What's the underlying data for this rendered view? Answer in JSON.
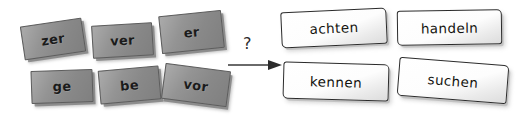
{
  "exercise": {
    "type": "word-formation-matching",
    "language": "German",
    "connector": {
      "question_mark": "?",
      "arrow_icon": "right-arrow-icon"
    },
    "prefixes": [
      {
        "label": "zer",
        "x": 22,
        "y": 22,
        "w": 62,
        "h": 34,
        "rotate": -8.5
      },
      {
        "label": "ver",
        "x": 92,
        "y": 24,
        "w": 61,
        "h": 33,
        "rotate": -3.5
      },
      {
        "label": "er",
        "x": 160,
        "y": 13,
        "w": 63,
        "h": 38,
        "rotate": -6.0
      },
      {
        "label": "ge",
        "x": 31,
        "y": 70,
        "w": 62,
        "h": 33,
        "rotate": -2.0
      },
      {
        "label": "be",
        "x": 99,
        "y": 68,
        "w": 61,
        "h": 34,
        "rotate": -5.0
      },
      {
        "label": "vor",
        "x": 163,
        "y": 67,
        "w": 66,
        "h": 36,
        "rotate": 7.5
      }
    ],
    "verbs": [
      {
        "label": "achten",
        "x": 281,
        "y": 10,
        "w": 106,
        "h": 36,
        "rotate": -2.6
      },
      {
        "label": "handeln",
        "x": 397,
        "y": 10,
        "w": 105,
        "h": 35,
        "rotate": -0.8
      },
      {
        "label": "kennen",
        "x": 283,
        "y": 63,
        "w": 106,
        "h": 37,
        "rotate": 1.6
      },
      {
        "label": "suchen",
        "x": 398,
        "y": 61,
        "w": 110,
        "h": 39,
        "rotate": 4.5
      }
    ],
    "colors": {
      "prefix_fill": "#8e8e8e",
      "prefix_border": "#5d5d5d",
      "verb_fill": "#ffffff",
      "verb_border": "#2b2b2b",
      "ink": "#14140f",
      "background": "#ffffff"
    }
  }
}
